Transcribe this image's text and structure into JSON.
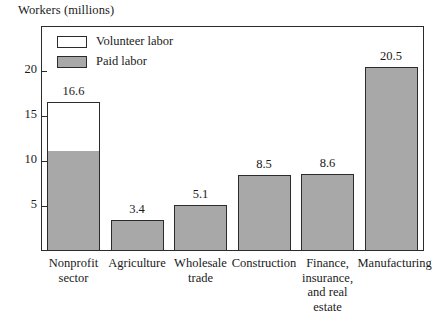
{
  "chart_data": {
    "type": "bar",
    "title": "",
    "ylabel": "Workers (millions)",
    "xlabel": "",
    "ylim": [
      0,
      23.3
    ],
    "yticks": [
      5,
      10,
      15,
      20
    ],
    "ytick_labels": [
      "5",
      "10",
      "15",
      "20"
    ],
    "grid": false,
    "stacked": true,
    "legend_position": "top-left",
    "categories": [
      "Nonprofit sector",
      "Agriculture",
      "Wholesale trade",
      "Construction",
      "Finance, insurance, and real estate",
      "Manufacturing"
    ],
    "category_label_lines": [
      [
        "Nonprofit",
        "sector"
      ],
      [
        "Agriculture"
      ],
      [
        "Wholesale",
        "trade"
      ],
      [
        "Construction"
      ],
      [
        "Finance,",
        "insurance,",
        "and real",
        "estate"
      ],
      [
        "Manufacturing"
      ]
    ],
    "values": [
      16.6,
      3.4,
      5.1,
      8.5,
      8.6,
      20.5
    ],
    "value_labels": [
      "16.6",
      "3.4",
      "5.1",
      "8.5",
      "8.6",
      "20.5"
    ],
    "series": [
      {
        "name": "Paid labor",
        "color": "#a8a8a8",
        "values": [
          11.0,
          3.4,
          5.1,
          8.5,
          8.6,
          20.5
        ]
      },
      {
        "name": "Volunteer labor",
        "color": "#ffffff",
        "values": [
          5.6,
          0,
          0,
          0,
          0,
          0
        ]
      }
    ]
  },
  "legend": {
    "items": [
      {
        "label": "Volunteer labor",
        "swatch": "volunteer"
      },
      {
        "label": "Paid labor",
        "swatch": "paid"
      }
    ]
  },
  "colors": {
    "bar_fill": "#a8a8a8",
    "bar_stroke": "#2b2b2b",
    "background": "#ffffff",
    "text": "#1a1a1a"
  }
}
